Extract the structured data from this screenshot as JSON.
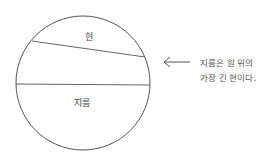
{
  "diagram": {
    "circle": {
      "cx": 83,
      "cy": 83,
      "r": 67,
      "stroke": "#555555"
    },
    "chord": {
      "x1": 32,
      "y1": 41,
      "x2": 145,
      "y2": 57,
      "label": "현"
    },
    "diameter": {
      "x1": 16,
      "y1": 84,
      "x2": 150,
      "y2": 85,
      "label": "지름"
    },
    "arrow": {
      "direction": "left"
    },
    "note": {
      "line1": "지름은 원 위의",
      "line2": "가장 긴 현이다."
    }
  }
}
